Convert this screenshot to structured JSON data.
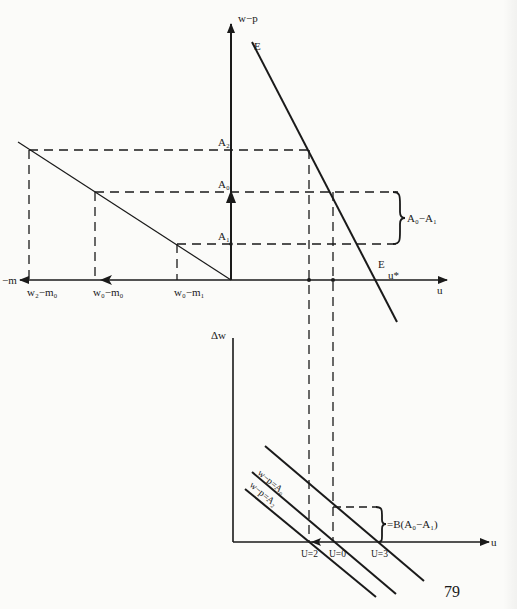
{
  "page": {
    "number": "79"
  },
  "upper_panel": {
    "y_axis_label": "w−p",
    "x_axis_label": "u",
    "neg_x_axis_label": "−m",
    "curve_label_top": "E",
    "curve_label_bottom": "E",
    "u_star_label": "u*",
    "y_levels": {
      "A2": "A₂",
      "A0": "A₀",
      "A1": "A₁"
    },
    "x_ticks": {
      "w2_m0": "w₂−m₀",
      "w0_m0": "w₀−m₀",
      "w0_m1": "w₀−m₁"
    },
    "brace_label": "A₀−A₁"
  },
  "lower_panel": {
    "y_axis_label": "Δw",
    "x_axis_label": "u",
    "line_labels": {
      "A0": "w−p=A₀",
      "A2": "w−p=A₂"
    },
    "x_ticks": {
      "U2": "U=2",
      "U0": "U=0",
      "U3": "U=3"
    },
    "brace_label": "=B(A₀−A₁)"
  }
}
